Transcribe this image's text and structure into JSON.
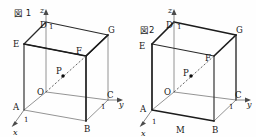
{
  "figures": [
    {
      "caption": "図 1",
      "axes": {
        "x_label": "x",
        "y_label": "y",
        "z_label": "z",
        "x_tick": "1",
        "y_tick": "1",
        "z_tick": "1"
      },
      "vertices": [
        {
          "name": "O",
          "label": "O"
        },
        {
          "name": "A",
          "label": "A"
        },
        {
          "name": "B",
          "label": "B"
        },
        {
          "name": "C",
          "label": "C"
        },
        {
          "name": "D",
          "label": "D"
        },
        {
          "name": "E",
          "label": "E"
        },
        {
          "name": "F",
          "label": "F"
        },
        {
          "name": "G",
          "label": "G"
        },
        {
          "name": "P",
          "label": "P"
        }
      ]
    },
    {
      "caption": "図2",
      "axes": {
        "x_label": "x",
        "y_label": "y",
        "z_label": "z",
        "x_tick": "1",
        "y_tick": "1",
        "z_tick": "1"
      },
      "vertices": [
        {
          "name": "O",
          "label": "O"
        },
        {
          "name": "A",
          "label": "A"
        },
        {
          "name": "B",
          "label": "B"
        },
        {
          "name": "C",
          "label": "C"
        },
        {
          "name": "D",
          "label": "D"
        },
        {
          "name": "E",
          "label": "E"
        },
        {
          "name": "F",
          "label": "F"
        },
        {
          "name": "G",
          "label": "G"
        },
        {
          "name": "P",
          "label": "P"
        },
        {
          "name": "M",
          "label": "M"
        }
      ]
    }
  ]
}
